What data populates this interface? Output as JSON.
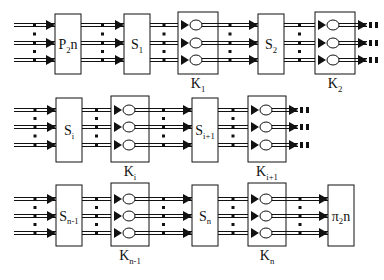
{
  "diagram": {
    "colors": {
      "line": "#111111",
      "box_fill": "#ffffff",
      "background": "#ffffff"
    },
    "rows": [
      {
        "blocks": [
          {
            "id": "p2n",
            "type": "perm",
            "label": "P",
            "sub": "2",
            "suffix": "n"
          },
          {
            "id": "s1",
            "type": "sbox",
            "label": "S",
            "sub": "1"
          },
          {
            "id": "k1",
            "type": "key",
            "label": "K",
            "sub": "1"
          },
          {
            "id": "s2",
            "type": "sbox",
            "label": "S",
            "sub": "2"
          },
          {
            "id": "k2",
            "type": "key",
            "label": "K",
            "sub": "2"
          }
        ],
        "continues": true
      },
      {
        "blocks": [
          {
            "id": "si",
            "type": "sbox",
            "label": "S",
            "sub": "i"
          },
          {
            "id": "ki",
            "type": "key",
            "label": "K",
            "sub": "i"
          },
          {
            "id": "si1",
            "type": "sbox",
            "label": "S",
            "sub": "i+1"
          },
          {
            "id": "ki1",
            "type": "key",
            "label": "K",
            "sub": "i+1"
          }
        ],
        "continues": true
      },
      {
        "blocks": [
          {
            "id": "sn1",
            "type": "sbox",
            "label": "S",
            "sub": "n-1"
          },
          {
            "id": "kn1",
            "type": "key",
            "label": "K",
            "sub": "n-1"
          },
          {
            "id": "sn",
            "type": "sbox",
            "label": "S",
            "sub": "n"
          },
          {
            "id": "kn",
            "type": "key",
            "label": "K",
            "sub": "n"
          },
          {
            "id": "pi2n",
            "type": "perm",
            "label": "π",
            "sub": "2",
            "suffix": "n"
          }
        ],
        "continues": false
      }
    ],
    "lanes_per_stage": 3,
    "ellipsis": "⋮"
  }
}
